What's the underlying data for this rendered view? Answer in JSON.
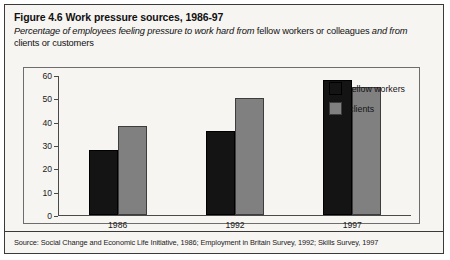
{
  "figure": {
    "title": "Figure 4.6 Work pressure sources, 1986-97",
    "subtitle_parts": [
      {
        "text": "Percentage of employees feeling pressure to work hard from",
        "style": "italic"
      },
      {
        "text": "fellow workers or colleagues",
        "style": "regular"
      },
      {
        "text": "and from",
        "style": "italic"
      },
      {
        "text": "clients or customers",
        "style": "regular"
      }
    ],
    "source": "Source: Social Change and Economic Life Initiative, 1986; Employment in Britain Survey, 1992; Skills Survey, 1997"
  },
  "colors": {
    "fellow_workers": "#141414",
    "clients": "#808080",
    "background": "#f7f5f2",
    "frame": "#3a3a3a"
  },
  "chart_data": {
    "type": "bar",
    "title": "Figure 4.6 Work pressure sources, 1986-97",
    "xlabel": "",
    "ylabel": "",
    "ylim": [
      0,
      60
    ],
    "yticks": [
      0,
      10,
      20,
      30,
      40,
      50,
      60
    ],
    "grid": false,
    "legend_position": "top-right",
    "categories": [
      "1986",
      "1992",
      "1997"
    ],
    "series": [
      {
        "name": "fellow workers",
        "color": "#141414",
        "values": [
          28,
          36,
          58
        ]
      },
      {
        "name": "clients",
        "color": "#808080",
        "values": [
          38,
          50,
          55
        ]
      }
    ]
  }
}
